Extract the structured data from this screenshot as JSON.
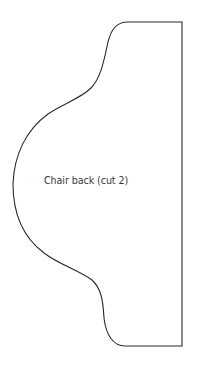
{
  "diagram": {
    "type": "sewing-pattern-piece",
    "piece_label": "Chair back (cut 2)",
    "stroke_color": "#2a2a2a",
    "background_color": "#ffffff"
  }
}
